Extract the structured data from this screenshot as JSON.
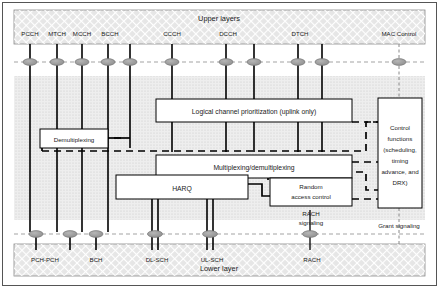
{
  "diagram": {
    "upper_layer_band": {
      "label": "Upper layers",
      "fill": "#e2e2e2"
    },
    "lower_layer_band": {
      "label": "Lower layer",
      "fill": "#e2e2e2"
    },
    "mac_band": {
      "fill": "#ececec"
    },
    "logical_channels": [
      {
        "name": "PCCH",
        "x": 30
      },
      {
        "name": "MTCH",
        "x": 57
      },
      {
        "name": "MCCH",
        "x": 82
      },
      {
        "name": "BCCH",
        "x": 108
      },
      {
        "name": "CCCH",
        "x": 172
      },
      {
        "name": "DCCH",
        "x": 226
      },
      {
        "name": "DTCH",
        "x": 298
      },
      {
        "name": "MAC Control",
        "x": 399
      }
    ],
    "transport_channels": [
      {
        "name": "PCH-PCH",
        "x": 36
      },
      {
        "name": "BCH",
        "x": 96
      },
      {
        "name": "DL-SCH",
        "x": 155
      },
      {
        "name": "UL-SCH",
        "x": 210
      },
      {
        "name": "RACH",
        "x": 310
      }
    ],
    "boxes": {
      "demultiplexing": {
        "label": "Demultiplexing"
      },
      "logical_channel_prioritization": {
        "label": "Logical channel prioritization (uplink only)"
      },
      "multiplexing_demultiplexing": {
        "label": "Multiplexing/demultiplexing"
      },
      "harq": {
        "label": "HARQ"
      },
      "random_access_control": {
        "line1": "Random",
        "line2": "access control"
      },
      "control_functions": {
        "line1": "Control",
        "line2": "functions",
        "line3": "(scheduling,",
        "line4": "timing",
        "line5": "advance, and",
        "line6": "DRX)"
      }
    },
    "annotations": {
      "rach_signaling_line1": "RACH",
      "rach_signaling_line2": "signaling",
      "grant_signaling": "Grant signaling"
    },
    "colors": {
      "band_fill": "#e2e2e2",
      "mac_fill": "#ececec",
      "box_fill": "#ffffff",
      "line": "#000000",
      "node_fill": "#9a9a9a",
      "text": "#1a1a1a"
    }
  }
}
